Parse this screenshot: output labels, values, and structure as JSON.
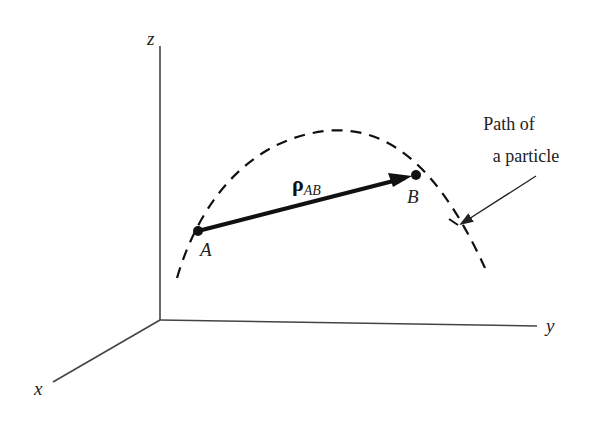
{
  "diagram": {
    "axes": {
      "z_label": "z",
      "y_label": "y",
      "x_label": "x",
      "origin": [
        160,
        320
      ]
    },
    "points": {
      "A": {
        "label": "A",
        "pos": [
          198,
          231
        ]
      },
      "B": {
        "label": "B",
        "pos": [
          416,
          175
        ]
      }
    },
    "vector": {
      "symbol": "ρ",
      "subscript": "AB",
      "from": "A",
      "to": "B"
    },
    "path_annotation": {
      "line1": "Path of",
      "line2": "a particle"
    },
    "colors": {
      "ink": "#111111",
      "axis": "#444444",
      "background": "#ffffff"
    }
  }
}
